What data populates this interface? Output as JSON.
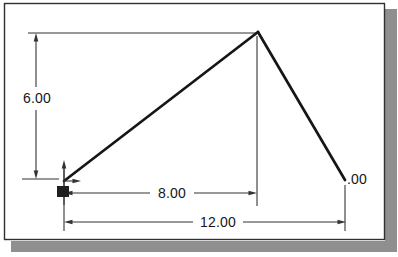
{
  "figure": {
    "kind": "dimensioned-cad-sketch",
    "dimensions": {
      "vertical": "6.00",
      "width_inner": "8.00",
      "width_overall": "12.00",
      "right_clipped": ".00"
    },
    "colors": {
      "line": "#161616",
      "thin_line": "#333333",
      "background": "#ffffff",
      "frame_border": "#2f2f2f",
      "shadow": "#8f8f8f",
      "origin_marker": "#1f1f1f"
    }
  }
}
